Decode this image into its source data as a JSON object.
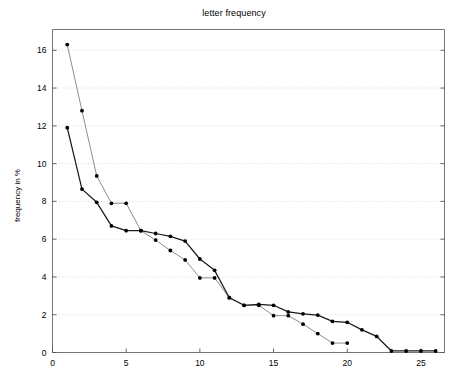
{
  "chart_data": {
    "type": "line",
    "title": "letter frequency",
    "xlabel": "",
    "ylabel": "frequency in %",
    "xlim": [
      0,
      26.6
    ],
    "ylim": [
      0,
      17.1
    ],
    "xticks": [
      0,
      5,
      10,
      15,
      20,
      25
    ],
    "yticks": [
      0,
      2,
      4,
      6,
      8,
      10,
      12,
      14,
      16
    ],
    "grid": "horizontal-dotted",
    "legend": "none",
    "series": [
      {
        "name": "series-1",
        "color": "#808080",
        "marker": "dot",
        "marker_color": "#000000",
        "x": [
          1,
          2,
          3,
          4,
          5,
          6,
          7,
          8,
          9,
          10,
          11,
          12,
          13,
          14,
          15,
          16,
          17,
          18,
          19,
          20
        ],
        "values": [
          16.3,
          12.8,
          9.35,
          7.9,
          7.9,
          6.45,
          5.95,
          5.4,
          4.9,
          3.95,
          3.95,
          2.9,
          2.5,
          2.5,
          1.95,
          1.95,
          1.5,
          1.0,
          0.5,
          0.5
        ]
      },
      {
        "name": "series-2",
        "color": "#1a1a1a",
        "marker": "dot",
        "marker_color": "#000000",
        "x": [
          1,
          2,
          3,
          4,
          5,
          6,
          7,
          8,
          9,
          10,
          11,
          12,
          13,
          14,
          15,
          16,
          17,
          18,
          19,
          20,
          21,
          22,
          23,
          24,
          25,
          26
        ],
        "values": [
          11.9,
          8.65,
          7.95,
          6.7,
          6.45,
          6.45,
          6.3,
          6.15,
          5.9,
          4.95,
          4.35,
          2.9,
          2.5,
          2.55,
          2.5,
          2.15,
          2.05,
          1.98,
          1.65,
          1.6,
          1.2,
          0.85,
          0.08,
          0.08,
          0.08,
          0.08
        ]
      }
    ]
  }
}
